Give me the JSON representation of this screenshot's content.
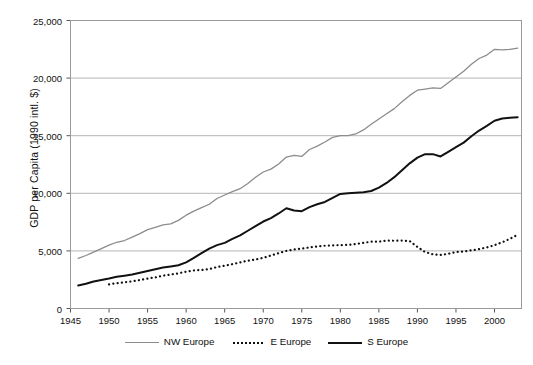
{
  "chart_data": {
    "type": "line",
    "title": "",
    "xlabel": "",
    "ylabel": "GDP per Capita (1990 intl. $)",
    "xlim": [
      1945,
      2003.5
    ],
    "ylim": [
      0,
      25000
    ],
    "grid": "horizontal",
    "legend_position": "bottom",
    "ytick_labels": [
      "25,000",
      "20,000",
      "15,000",
      "10,000",
      "5,000",
      "0"
    ],
    "ytick_values": [
      25000,
      20000,
      15000,
      10000,
      5000,
      0
    ],
    "xtick_labels": [
      "1945",
      "1950",
      "1955",
      "1960",
      "1965",
      "1970",
      "1975",
      "1980",
      "1985",
      "1990",
      "1995",
      "2000"
    ],
    "xtick_values": [
      1945,
      1950,
      1955,
      1960,
      1965,
      1970,
      1975,
      1980,
      1985,
      1990,
      1995,
      2000
    ],
    "series": [
      {
        "name": "NW Europe",
        "color": "#8c8c8c",
        "style": "solid",
        "width": 1.3,
        "x": [
          1946,
          1947,
          1948,
          1949,
          1950,
          1951,
          1952,
          1953,
          1954,
          1955,
          1956,
          1957,
          1958,
          1959,
          1960,
          1961,
          1962,
          1963,
          1964,
          1965,
          1966,
          1967,
          1968,
          1969,
          1970,
          1971,
          1972,
          1973,
          1974,
          1975,
          1976,
          1977,
          1978,
          1979,
          1980,
          1981,
          1982,
          1983,
          1984,
          1985,
          1986,
          1987,
          1988,
          1989,
          1990,
          1991,
          1992,
          1993,
          1994,
          1995,
          1996,
          1997,
          1998,
          1999,
          2000,
          2001,
          2002,
          2003
        ],
        "y": [
          4350,
          4600,
          4900,
          5200,
          5500,
          5750,
          5900,
          6200,
          6500,
          6850,
          7050,
          7250,
          7350,
          7650,
          8100,
          8450,
          8750,
          9050,
          9550,
          9850,
          10150,
          10400,
          10850,
          11400,
          11850,
          12100,
          12550,
          13150,
          13300,
          13200,
          13800,
          14100,
          14450,
          14850,
          15000,
          15000,
          15150,
          15500,
          16000,
          16450,
          16900,
          17350,
          17950,
          18500,
          18950,
          19050,
          19150,
          19100,
          19600,
          20100,
          20600,
          21200,
          21700,
          22000,
          22500,
          22450,
          22500,
          22600
        ],
        "y_start_label": 4350,
        "y_end_label": 22600
      },
      {
        "name": "E Europe",
        "color": "#111111",
        "style": "dotted",
        "width": 2.2,
        "x": [
          1950,
          1951,
          1952,
          1953,
          1954,
          1955,
          1956,
          1957,
          1958,
          1959,
          1960,
          1961,
          1962,
          1963,
          1964,
          1965,
          1966,
          1967,
          1968,
          1969,
          1970,
          1971,
          1972,
          1973,
          1974,
          1975,
          1976,
          1977,
          1978,
          1979,
          1980,
          1981,
          1982,
          1983,
          1984,
          1985,
          1986,
          1987,
          1988,
          1989,
          1990,
          1991,
          1992,
          1993,
          1994,
          1995,
          1996,
          1997,
          1998,
          1999,
          2000,
          2001,
          2002,
          2003
        ],
        "y": [
          2100,
          2200,
          2280,
          2360,
          2470,
          2600,
          2700,
          2850,
          2950,
          3050,
          3200,
          3300,
          3350,
          3420,
          3600,
          3720,
          3850,
          4000,
          4150,
          4250,
          4400,
          4600,
          4800,
          5000,
          5120,
          5200,
          5300,
          5380,
          5450,
          5480,
          5500,
          5520,
          5600,
          5700,
          5800,
          5800,
          5900,
          5880,
          5900,
          5850,
          5350,
          4900,
          4700,
          4650,
          4750,
          4900,
          4950,
          5050,
          5150,
          5300,
          5500,
          5750,
          6050,
          6400
        ],
        "y_start_label": 2100,
        "y_end_label": 6400
      },
      {
        "name": "S Europe",
        "color": "#111111",
        "style": "solid",
        "width": 2.0,
        "x": [
          1946,
          1947,
          1948,
          1949,
          1950,
          1951,
          1952,
          1953,
          1954,
          1955,
          1956,
          1957,
          1958,
          1959,
          1960,
          1961,
          1962,
          1963,
          1964,
          1965,
          1966,
          1967,
          1968,
          1969,
          1970,
          1971,
          1972,
          1973,
          1974,
          1975,
          1976,
          1977,
          1978,
          1979,
          1980,
          1981,
          1982,
          1983,
          1984,
          1985,
          1986,
          1987,
          1988,
          1989,
          1990,
          1991,
          1992,
          1993,
          1994,
          1995,
          1996,
          1997,
          1998,
          1999,
          2000,
          2001,
          2002,
          2003
        ],
        "y": [
          2000,
          2150,
          2350,
          2480,
          2600,
          2750,
          2850,
          2950,
          3100,
          3250,
          3400,
          3550,
          3650,
          3750,
          4000,
          4400,
          4800,
          5200,
          5500,
          5700,
          6050,
          6350,
          6750,
          7150,
          7550,
          7850,
          8250,
          8700,
          8500,
          8450,
          8800,
          9050,
          9250,
          9600,
          9950,
          10000,
          10050,
          10100,
          10200,
          10500,
          10900,
          11400,
          12000,
          12600,
          13100,
          13400,
          13400,
          13200,
          13600,
          14000,
          14400,
          14950,
          15450,
          15850,
          16300,
          16500,
          16550,
          16600
        ],
        "y_start_label": 2000,
        "y_end_label": 16600
      }
    ]
  },
  "legend": {
    "items": [
      {
        "label": "NW Europe"
      },
      {
        "label": "E Europe"
      },
      {
        "label": "S Europe"
      }
    ]
  }
}
